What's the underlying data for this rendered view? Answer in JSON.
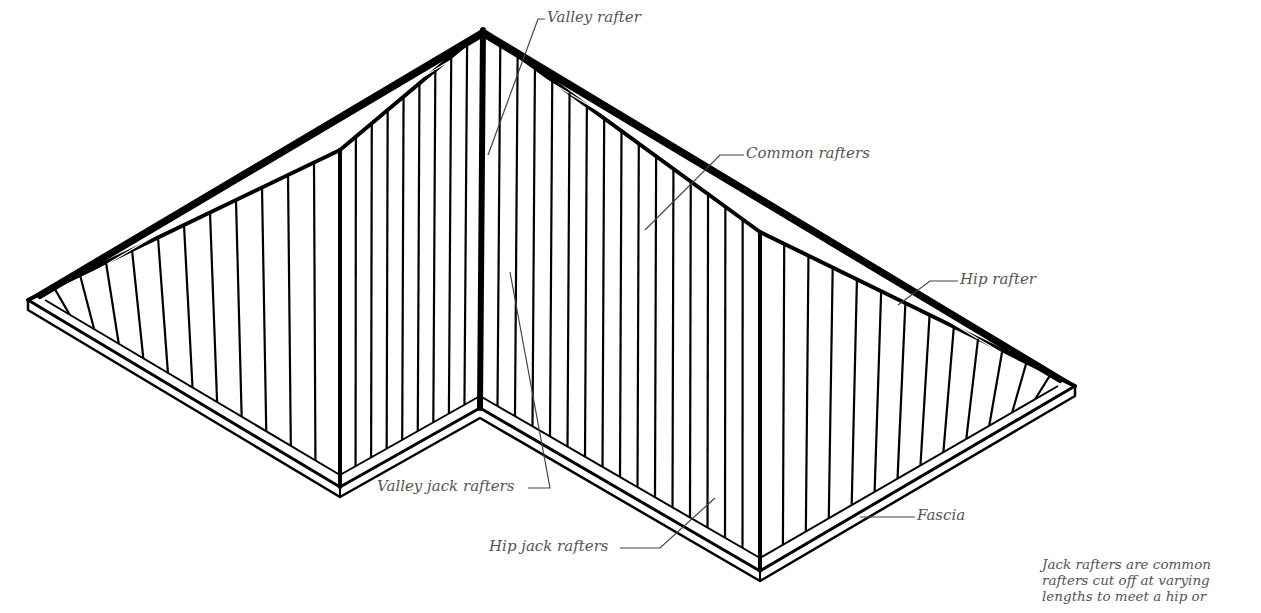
{
  "diagram": {
    "labels": {
      "valley_rafter": "Valley rafter",
      "common_rafters": "Common rafters",
      "hip_rafter": "Hip rafter",
      "valley_jack_rafters": "Valley jack rafters",
      "hip_jack_rafters": "Hip jack rafters",
      "fascia": "Fascia"
    },
    "note_lines": [
      "Jack rafters are common",
      "rafters cut off at varying",
      "lengths to meet a hip or"
    ],
    "colors": {
      "ink": "#000000",
      "label_text": "#555555",
      "background": "#ffffff"
    }
  }
}
